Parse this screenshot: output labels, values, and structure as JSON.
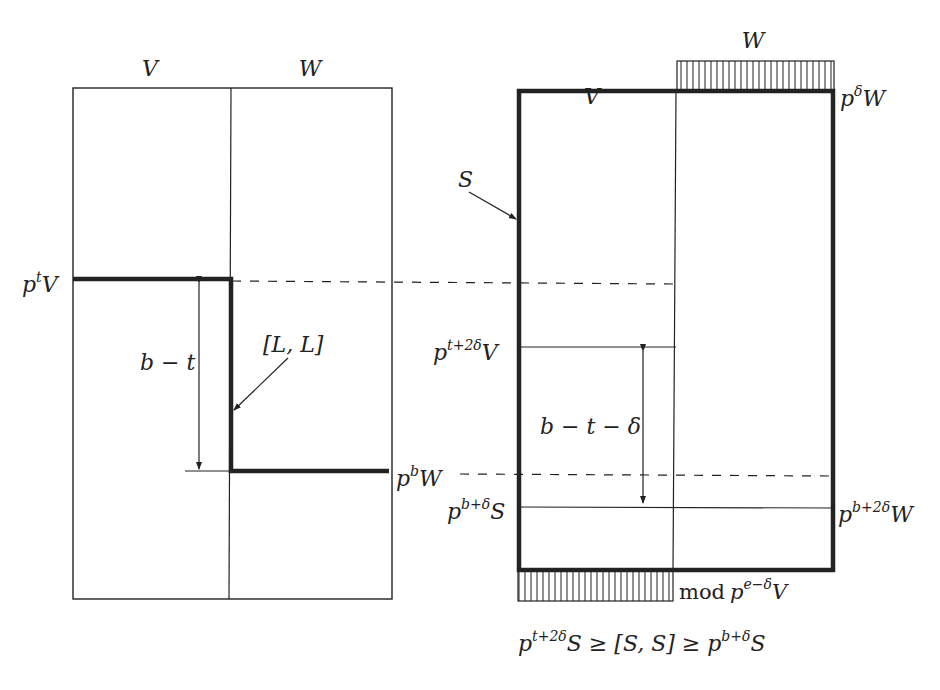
{
  "left_panel": {
    "col_labels": {
      "v": "V",
      "w": "W"
    },
    "labels": {
      "ptV_base": "p",
      "ptV_sup": "t",
      "ptV_tail": "V",
      "pbW_base": "p",
      "pbW_sup": "b",
      "pbW_tail": "W",
      "bracket_LL": "[L, L]",
      "dist": "b − t"
    }
  },
  "right_panel": {
    "col_labels": {
      "v": "V",
      "w": "W"
    },
    "labels": {
      "S": "S",
      "pdW_base": "p",
      "pdW_sup": "δ",
      "pdW_tail": "W",
      "pt2dV_base": "p",
      "pt2dV_sup": "t+2δ",
      "pt2dV_tail": "V",
      "pbdS_base": "p",
      "pbdS_sup": "b+δ",
      "pbdS_tail": "S",
      "pb2dW_base": "p",
      "pb2dW_sup": "b+2δ",
      "pb2dW_tail": "W",
      "dist": "b − t − δ",
      "mod_word": "mod",
      "mod_base": "p",
      "mod_sup": "e−δ",
      "mod_tail": "V"
    }
  },
  "caption": {
    "p1_base": "p",
    "p1_sup": "t+2δ",
    "p1_tail": "S",
    "ge1": " ≥ [S, S] ≥ ",
    "p2_base": "p",
    "p2_sup": "b+δ",
    "p2_tail": "S"
  },
  "colors": {
    "ink": "#222222",
    "background": "#ffffff"
  }
}
